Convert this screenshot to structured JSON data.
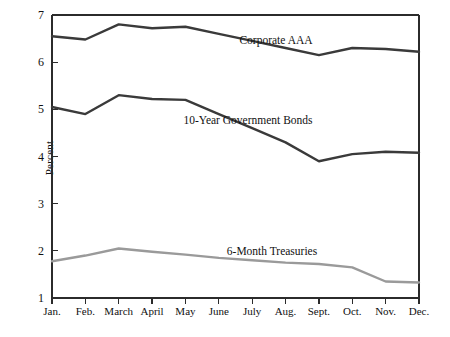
{
  "chart_data": {
    "type": "line",
    "title": "",
    "xlabel": "",
    "ylabel": "Percent",
    "categories": [
      "Jan.",
      "Feb.",
      "March",
      "April",
      "May",
      "June",
      "July",
      "Aug.",
      "Sept.",
      "Oct.",
      "Nov.",
      "Dec."
    ],
    "ylim": [
      1,
      7
    ],
    "yticks": [
      1,
      2,
      3,
      4,
      5,
      6,
      7
    ],
    "ytick_labels": [
      "1",
      "2",
      "3",
      "4",
      "5",
      "6",
      "7"
    ],
    "grid": false,
    "legend_position": "inline-annotations",
    "series": [
      {
        "name": "Corporate AAA",
        "color": "#3a3a3a",
        "values": [
          6.55,
          6.48,
          6.8,
          6.72,
          6.75,
          6.6,
          6.45,
          6.3,
          6.15,
          6.3,
          6.28,
          6.22
        ]
      },
      {
        "name": "10-Year Government Bonds",
        "color": "#3a3a3a",
        "values": [
          5.05,
          4.9,
          5.3,
          5.22,
          5.2,
          4.9,
          4.6,
          4.3,
          3.9,
          4.05,
          4.1,
          4.08
        ]
      },
      {
        "name": "6-Month Treasuries",
        "color": "#9a9a9a",
        "values": [
          1.78,
          1.9,
          2.05,
          1.98,
          1.92,
          1.85,
          1.8,
          1.75,
          1.72,
          1.65,
          1.35,
          1.33
        ]
      }
    ],
    "annotations": [
      {
        "text": "Corporate AAA",
        "x_px": 276,
        "y_px": 34
      },
      {
        "text": "10-Year Government Bonds",
        "x_px": 248,
        "y_px": 114
      },
      {
        "text": "6-Month Treasuries",
        "x_px": 272,
        "y_px": 245
      }
    ]
  },
  "axes": {
    "line_color": "#2b2b2b",
    "plot_left_px": 52,
    "plot_right_px": 419,
    "plot_top_px": 15,
    "plot_bottom_px": 298
  }
}
